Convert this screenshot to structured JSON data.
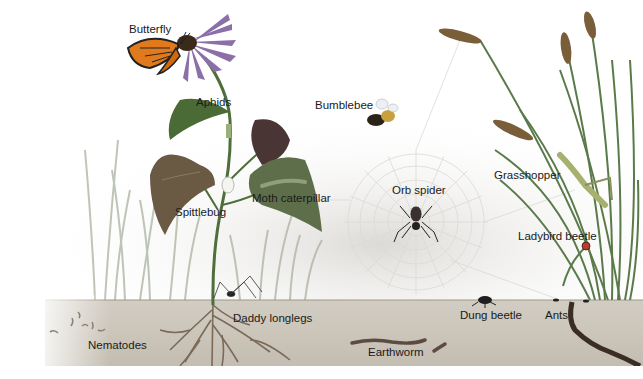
{
  "diagram": {
    "colors": {
      "background": "#ffffff",
      "haze": "#e6e6e4",
      "soil": "#ccc6bc",
      "soil_edge": "#a59d90",
      "plant_green": "#4e7a3e",
      "leaf_dark": "#3b5e30",
      "leaf_purple": "#5a3a3a",
      "grass": "#6c8a5a",
      "wheat": "#8a6a3a",
      "butterfly_orange": "#e07a1c",
      "flower_petal": "#8b6fa8",
      "text": "#1a1a1a"
    },
    "labels": [
      {
        "id": "butterfly",
        "text": "Butterfly",
        "x": 129,
        "y": 24
      },
      {
        "id": "aphids",
        "text": "Aphids",
        "x": 196,
        "y": 97
      },
      {
        "id": "bumblebee",
        "text": "Bumblebee",
        "x": 315,
        "y": 100
      },
      {
        "id": "spittlebug",
        "text": "Spittlebug",
        "x": 175,
        "y": 207
      },
      {
        "id": "moth-caterpillar",
        "text": "Moth caterpillar",
        "x": 252,
        "y": 193
      },
      {
        "id": "orb-spider",
        "text": "Orb spider",
        "x": 392,
        "y": 185
      },
      {
        "id": "grasshopper",
        "text": "Grasshopper",
        "x": 494,
        "y": 170
      },
      {
        "id": "ladybird-beetle",
        "text": "Ladybird beetle",
        "x": 518,
        "y": 231
      },
      {
        "id": "daddy-longlegs",
        "text": "Daddy longlegs",
        "x": 233,
        "y": 313
      },
      {
        "id": "dung-beetle",
        "text": "Dung beetle",
        "x": 460,
        "y": 310
      },
      {
        "id": "ants",
        "text": "Ants",
        "x": 545,
        "y": 310
      },
      {
        "id": "nematodes",
        "text": "Nematodes",
        "x": 88,
        "y": 340
      },
      {
        "id": "earthworm",
        "text": "Earthworm",
        "x": 368,
        "y": 347
      }
    ]
  }
}
